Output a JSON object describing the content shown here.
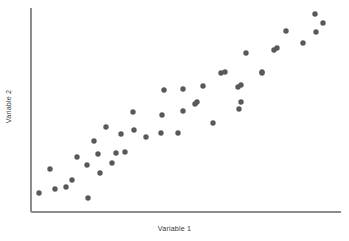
{
  "figure": {
    "name": "scatter-plot-figure",
    "background_color": "#ffffff"
  },
  "axes": {
    "x_label": "Variable 1",
    "y_label": "Variable 2",
    "axis_color": "#8c8c8c",
    "label_color": "#3a3a3a",
    "x_axis": {
      "x1": 31,
      "y1": 212,
      "x2": 341,
      "y2": 212
    },
    "y_axis": {
      "x1": 31,
      "y1": 8,
      "x2": 31,
      "y2": 212
    }
  },
  "marker": {
    "color": "#595959",
    "radius": 2.7,
    "shape": "circle"
  },
  "chart_data": {
    "type": "scatter",
    "title": "",
    "xlabel": "Variable 1",
    "ylabel": "Variable 2",
    "grid": false,
    "legend": null,
    "xlim": [
      0,
      100
    ],
    "ylim": [
      0,
      100
    ],
    "axis_ticks": {
      "x": [],
      "y": []
    },
    "n_points": 45,
    "series": [
      {
        "name": "observations",
        "color": "#595959",
        "points_px": [
          [
            39,
            193
          ],
          [
            50,
            169
          ],
          [
            55,
            189
          ],
          [
            66,
            187
          ],
          [
            88,
            198
          ],
          [
            77,
            157
          ],
          [
            87,
            165
          ],
          [
            98,
            154
          ],
          [
            112,
            163
          ],
          [
            116,
            153
          ],
          [
            125,
            152
          ],
          [
            94,
            141
          ],
          [
            106,
            127
          ],
          [
            121,
            134
          ],
          [
            134,
            130
          ],
          [
            146,
            137
          ],
          [
            161,
            133
          ],
          [
            178,
            133
          ],
          [
            162,
            115
          ],
          [
            183,
            111
          ],
          [
            195,
            104
          ],
          [
            164,
            90
          ],
          [
            183,
            89
          ],
          [
            197,
            102
          ],
          [
            203,
            86
          ],
          [
            221,
            73
          ],
          [
            213,
            123
          ],
          [
            225,
            72
          ],
          [
            238,
            87
          ],
          [
            239,
            109
          ],
          [
            241,
            85
          ],
          [
            241,
            102
          ],
          [
            246,
            53
          ],
          [
            262,
            73
          ],
          [
            262,
            72
          ],
          [
            274,
            50
          ],
          [
            277,
            48
          ],
          [
            286,
            31
          ],
          [
            303,
            43
          ],
          [
            315,
            14
          ],
          [
            316,
            32
          ],
          [
            323,
            23
          ],
          [
            72,
            180
          ],
          [
            100,
            173
          ],
          [
            133,
            112
          ]
        ],
        "x": [
          2.6,
          6.1,
          7.7,
          11.3,
          18.4,
          14.8,
          18.1,
          21.6,
          26.1,
          27.4,
          30.3,
          20.3,
          24.2,
          29.0,
          33.2,
          37.1,
          41.9,
          47.4,
          42.3,
          49.0,
          52.9,
          42.9,
          49.0,
          53.5,
          55.5,
          61.3,
          58.7,
          62.6,
          66.8,
          67.1,
          67.7,
          67.7,
          69.4,
          74.5,
          74.5,
          78.4,
          79.4,
          82.3,
          87.7,
          91.6,
          91.9,
          94.2,
          13.2,
          22.3,
          32.9
        ],
        "y": [
          9.3,
          21.1,
          11.3,
          12.3,
          6.9,
          26.9,
          23.0,
          28.4,
          24.0,
          28.9,
          29.4,
          34.8,
          41.7,
          38.2,
          40.2,
          36.8,
          38.7,
          38.7,
          47.5,
          49.5,
          52.9,
          59.8,
          60.3,
          53.9,
          61.8,
          68.1,
          43.6,
          68.6,
          61.3,
          50.5,
          62.3,
          53.9,
          78.0,
          68.1,
          68.6,
          79.4,
          80.4,
          88.7,
          82.8,
          97.1,
          88.2,
          92.6,
          15.7,
          19.1,
          49.0
        ]
      }
    ]
  }
}
